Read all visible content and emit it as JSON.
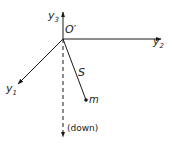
{
  "diagram": {
    "origin": {
      "label": "O′",
      "x": 63,
      "y": 39
    },
    "axes": [
      {
        "name": "y3",
        "label": "y",
        "subscript": "3",
        "direction": "up",
        "end": [
          63,
          11
        ]
      },
      {
        "name": "y2",
        "label": "y",
        "subscript": "2",
        "direction": "right",
        "end": [
          161,
          39
        ]
      },
      {
        "name": "y1",
        "label": "y",
        "subscript": "1",
        "direction": "down-left",
        "end": [
          17,
          84
        ]
      }
    ],
    "pendulum": {
      "string_label": "S",
      "mass_label": "m",
      "mass_pos": [
        86,
        100
      ]
    },
    "down_indicator": {
      "label": "(down)",
      "end": [
        63,
        137
      ]
    },
    "colors": {
      "line": "#1a1a1a",
      "background": "#ffffff"
    }
  }
}
